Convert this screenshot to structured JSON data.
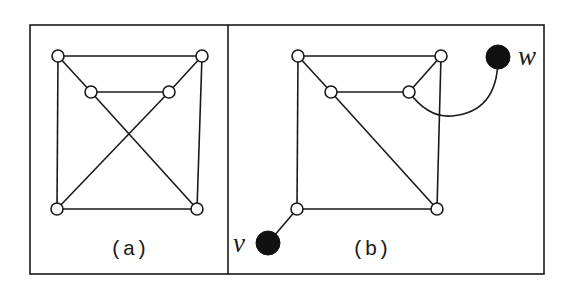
{
  "figure": {
    "panels": [
      {
        "id": "a",
        "label": "(a)",
        "nodes": [
          {
            "id": "a-tl",
            "x": 58,
            "y": 56,
            "type": "open"
          },
          {
            "id": "a-tr",
            "x": 202,
            "y": 56,
            "type": "open"
          },
          {
            "id": "a-il",
            "x": 91,
            "y": 92,
            "type": "open"
          },
          {
            "id": "a-ir",
            "x": 169,
            "y": 92,
            "type": "open"
          },
          {
            "id": "a-bl",
            "x": 57,
            "y": 209,
            "type": "open"
          },
          {
            "id": "a-br",
            "x": 197,
            "y": 209,
            "type": "open"
          }
        ],
        "edges": [
          [
            "a-tl",
            "a-tr"
          ],
          [
            "a-tl",
            "a-bl"
          ],
          [
            "a-tr",
            "a-br"
          ],
          [
            "a-bl",
            "a-br"
          ],
          [
            "a-il",
            "a-ir"
          ],
          [
            "a-tl",
            "a-il"
          ],
          [
            "a-tr",
            "a-ir"
          ],
          [
            "a-il",
            "a-br"
          ],
          [
            "a-ir",
            "a-bl"
          ]
        ]
      },
      {
        "id": "b",
        "label": "(b)",
        "nodes": [
          {
            "id": "b-tl",
            "x": 298,
            "y": 56,
            "type": "open"
          },
          {
            "id": "b-tr",
            "x": 441,
            "y": 56,
            "type": "open"
          },
          {
            "id": "b-il",
            "x": 331,
            "y": 92,
            "type": "open"
          },
          {
            "id": "b-ir",
            "x": 409,
            "y": 92,
            "type": "open"
          },
          {
            "id": "b-bl",
            "x": 297,
            "y": 209,
            "type": "open"
          },
          {
            "id": "b-br",
            "x": 437,
            "y": 209,
            "type": "open"
          },
          {
            "id": "w",
            "x": 498,
            "y": 57,
            "type": "filled",
            "label": "w"
          },
          {
            "id": "v",
            "x": 268,
            "y": 243,
            "type": "filled",
            "label": "v"
          }
        ],
        "edges": [
          [
            "b-tl",
            "b-tr"
          ],
          [
            "b-tl",
            "b-bl"
          ],
          [
            "b-tr",
            "b-br"
          ],
          [
            "b-bl",
            "b-br"
          ],
          [
            "b-il",
            "b-ir"
          ],
          [
            "b-tl",
            "b-il"
          ],
          [
            "b-tr",
            "b-ir"
          ],
          [
            "b-il",
            "b-br"
          ],
          [
            "b-bl",
            "v"
          ]
        ],
        "curved_edges": [
          [
            "b-ir",
            "w"
          ]
        ]
      }
    ],
    "vertex_labels": {
      "w": "w",
      "v": "v"
    },
    "panel_labels": {
      "a": "(a)",
      "b": "(b)"
    }
  }
}
